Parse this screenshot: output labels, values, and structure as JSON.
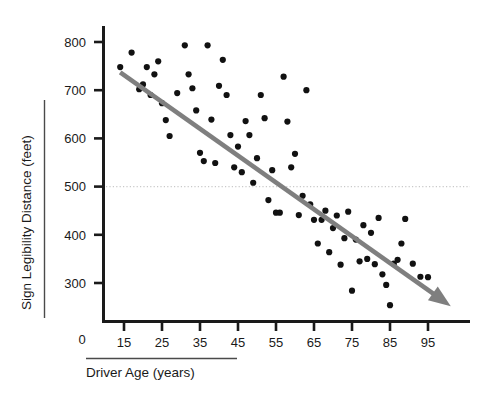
{
  "chart_data": {
    "type": "scatter",
    "title": "",
    "subtitle": "",
    "xlabel": "Driver Age (years)",
    "ylabel": "Sign Legibility Distance (feet)",
    "xlim": [
      10,
      102
    ],
    "ylim": [
      230,
      830
    ],
    "x_ticks": [
      15,
      25,
      35,
      45,
      55,
      65,
      75,
      85,
      95
    ],
    "x_tick_labels": [
      "15",
      "25",
      "35",
      "45",
      "55",
      "65",
      "75",
      "85",
      "95"
    ],
    "y_ticks": [
      300,
      400,
      500,
      600,
      700,
      800
    ],
    "y_tick_labels": [
      "300",
      "400",
      "500",
      "600",
      "700",
      "800"
    ],
    "origin_label": "0",
    "grid": false,
    "legend": "none",
    "marker_color": "#111111",
    "marker_size_px": 3.1,
    "trendline": {
      "label": "negative-trend-arrow",
      "color": "#7f7f7f",
      "width_px": 4.6,
      "x_start": 14,
      "y_start": 737,
      "x_end": 101,
      "y_end": 252,
      "arrowhead": true
    },
    "reference_line": {
      "label": "reference-line-500-feet",
      "orientation": "horizontal",
      "value": 500,
      "style": "dotted",
      "color": "#c9c9c9"
    },
    "points": [
      {
        "x": 14,
        "y": 748
      },
      {
        "x": 17,
        "y": 778
      },
      {
        "x": 19,
        "y": 702
      },
      {
        "x": 20,
        "y": 712
      },
      {
        "x": 21,
        "y": 748
      },
      {
        "x": 22,
        "y": 690
      },
      {
        "x": 23,
        "y": 733
      },
      {
        "x": 24,
        "y": 760
      },
      {
        "x": 25,
        "y": 673
      },
      {
        "x": 26,
        "y": 638
      },
      {
        "x": 27,
        "y": 605
      },
      {
        "x": 29,
        "y": 694
      },
      {
        "x": 31,
        "y": 793
      },
      {
        "x": 32,
        "y": 733
      },
      {
        "x": 33,
        "y": 704
      },
      {
        "x": 34,
        "y": 658
      },
      {
        "x": 35,
        "y": 570
      },
      {
        "x": 36,
        "y": 553
      },
      {
        "x": 37,
        "y": 793
      },
      {
        "x": 38,
        "y": 639
      },
      {
        "x": 39,
        "y": 549
      },
      {
        "x": 40,
        "y": 709
      },
      {
        "x": 41,
        "y": 763
      },
      {
        "x": 42,
        "y": 690
      },
      {
        "x": 43,
        "y": 607
      },
      {
        "x": 44,
        "y": 540
      },
      {
        "x": 45,
        "y": 583
      },
      {
        "x": 46,
        "y": 530
      },
      {
        "x": 47,
        "y": 636
      },
      {
        "x": 48,
        "y": 607
      },
      {
        "x": 49,
        "y": 508
      },
      {
        "x": 50,
        "y": 559
      },
      {
        "x": 51,
        "y": 690
      },
      {
        "x": 52,
        "y": 642
      },
      {
        "x": 53,
        "y": 472
      },
      {
        "x": 54,
        "y": 534
      },
      {
        "x": 55,
        "y": 446
      },
      {
        "x": 56,
        "y": 446
      },
      {
        "x": 57,
        "y": 728
      },
      {
        "x": 58,
        "y": 635
      },
      {
        "x": 59,
        "y": 540
      },
      {
        "x": 60,
        "y": 568
      },
      {
        "x": 61,
        "y": 441
      },
      {
        "x": 62,
        "y": 481
      },
      {
        "x": 63,
        "y": 700
      },
      {
        "x": 64,
        "y": 463
      },
      {
        "x": 65,
        "y": 431
      },
      {
        "x": 66,
        "y": 382
      },
      {
        "x": 67,
        "y": 431
      },
      {
        "x": 68,
        "y": 450
      },
      {
        "x": 69,
        "y": 364
      },
      {
        "x": 70,
        "y": 414
      },
      {
        "x": 71,
        "y": 440
      },
      {
        "x": 72,
        "y": 338
      },
      {
        "x": 73,
        "y": 393
      },
      {
        "x": 74,
        "y": 448
      },
      {
        "x": 75,
        "y": 284
      },
      {
        "x": 76,
        "y": 390
      },
      {
        "x": 77,
        "y": 345
      },
      {
        "x": 78,
        "y": 420
      },
      {
        "x": 79,
        "y": 350
      },
      {
        "x": 80,
        "y": 404
      },
      {
        "x": 81,
        "y": 339
      },
      {
        "x": 82,
        "y": 435
      },
      {
        "x": 83,
        "y": 318
      },
      {
        "x": 84,
        "y": 296
      },
      {
        "x": 85,
        "y": 254
      },
      {
        "x": 86,
        "y": 340
      },
      {
        "x": 87,
        "y": 348
      },
      {
        "x": 88,
        "y": 382
      },
      {
        "x": 89,
        "y": 433
      },
      {
        "x": 91,
        "y": 340
      },
      {
        "x": 93,
        "y": 313
      },
      {
        "x": 95,
        "y": 312
      },
      {
        "x": 97,
        "y": 272
      }
    ]
  }
}
